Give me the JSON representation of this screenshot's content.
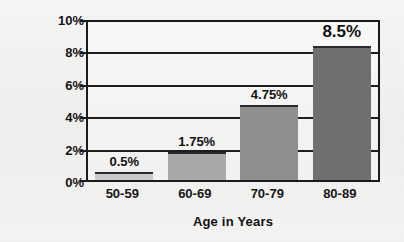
{
  "chart_data": {
    "type": "bar",
    "title": "",
    "xlabel": "Age in Years",
    "ylabel": "Prevalence",
    "categories": [
      "50-59",
      "60-69",
      "70-79",
      "80-89"
    ],
    "values": [
      0.5,
      1.75,
      4.75,
      8.5
    ],
    "value_labels": [
      "0.5%",
      "1.75%",
      "4.75%",
      "8.5%"
    ],
    "ylim": [
      0,
      10
    ],
    "ytick_labels": [
      "0%",
      "2%",
      "4%",
      "6%",
      "8%",
      "10%"
    ],
    "ytick_values": [
      0,
      2,
      4,
      6,
      8,
      10
    ],
    "grid": true,
    "legend": "none",
    "bar_colors": [
      "#c9c9c9",
      "#a9a9a9",
      "#8f8f8f",
      "#6f6f6f"
    ],
    "axis_color": "#1b1b1b",
    "background": "#f2f2f0"
  }
}
